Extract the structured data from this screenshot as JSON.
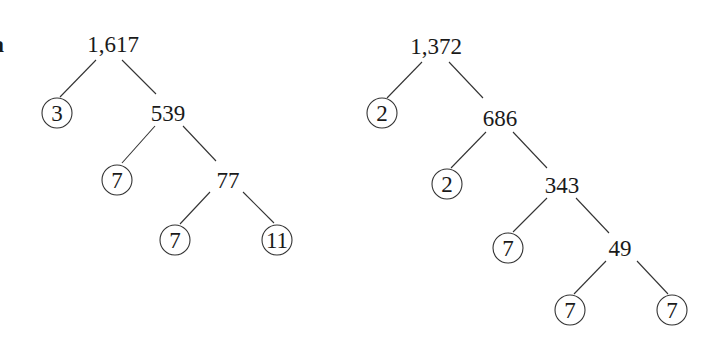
{
  "label": "a",
  "trees": [
    {
      "root": "1,617",
      "nodes": {
        "n0": "1,617",
        "n1": "3",
        "n2": "539",
        "n3": "7",
        "n4": "77",
        "n5": "7",
        "n6": "11"
      },
      "prime_factors": [
        "3",
        "7",
        "7",
        "11"
      ]
    },
    {
      "root": "1,372",
      "nodes": {
        "n0": "1,372",
        "n1": "2",
        "n2": "686",
        "n3": "2",
        "n4": "343",
        "n5": "7",
        "n6": "49",
        "n7": "7",
        "n8": "7"
      },
      "prime_factors": [
        "2",
        "2",
        "7",
        "7",
        "7"
      ]
    }
  ]
}
